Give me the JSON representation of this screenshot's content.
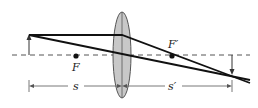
{
  "diagram": {
    "type": "thin converging lens ray diagram",
    "labels": {
      "focal_point_object_side": "F",
      "focal_point_image_side": "F′",
      "object_distance": "s",
      "image_distance": "s′"
    },
    "elements": {
      "optical_axis": "dashed horizontal line",
      "lens": "biconvex lens (gray)",
      "object": "upright arrow left of lens",
      "image": "inverted arrow right of lens",
      "rays": [
        "parallel ray refracted through F′",
        "central ray through lens center"
      ]
    },
    "colors": {
      "lens_fill": "#c8c8c8",
      "lens_stroke": "#555555",
      "ray": "#111111",
      "axis": "#555555",
      "background": "#ffffff"
    }
  }
}
